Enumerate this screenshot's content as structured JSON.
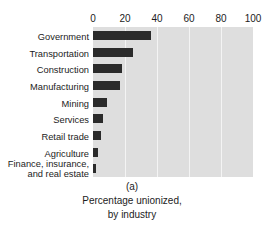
{
  "top_clipped_heading": "Source: Bureau of Labor Statistics, Washington",
  "caption": {
    "panel_letter": "(a)",
    "line1": "Percentage unionized,",
    "line2": "by industry"
  },
  "chart_data": {
    "type": "bar",
    "orientation": "horizontal",
    "title": "",
    "xlabel": "",
    "ylabel": "",
    "categories": [
      "Government",
      "Transportation",
      "Construction",
      "Manufacturing",
      "Mining",
      "Services",
      "Retail trade",
      "Agriculture",
      "Finance, insurance, and real estate"
    ],
    "values": [
      36,
      25,
      18,
      17,
      9,
      6,
      5,
      3,
      2
    ],
    "xticks": [
      0,
      20,
      40,
      60,
      80,
      100
    ],
    "xlim": [
      0,
      100
    ],
    "grid": true,
    "legend": "none",
    "colors": {
      "bar": "#2b2b2b",
      "plot_background": "#dedede",
      "gridline": "#f4f4f4",
      "text": "#1c1c1c"
    }
  }
}
